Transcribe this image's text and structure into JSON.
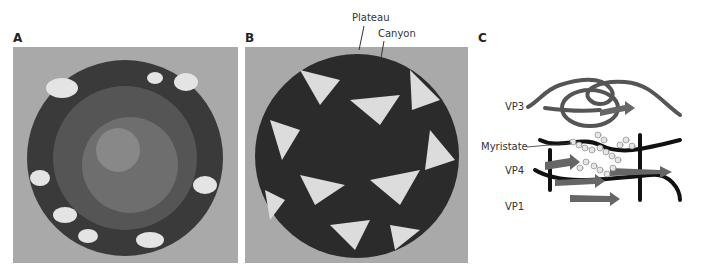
{
  "panels": [
    {
      "id": "A",
      "label": "A"
    },
    {
      "id": "B",
      "label": "B",
      "annotations": [
        "Plateau",
        "Canyon"
      ]
    },
    {
      "id": "C",
      "label": "C",
      "annotations": [
        "VP3",
        "Myristate",
        "VP4",
        "VP1"
      ]
    }
  ],
  "colors": {
    "background_box": "#a9a9a9",
    "dark_protein": "#2b2b2b",
    "light_protein": "#e6e6e6",
    "mid_protein": "#777777"
  }
}
